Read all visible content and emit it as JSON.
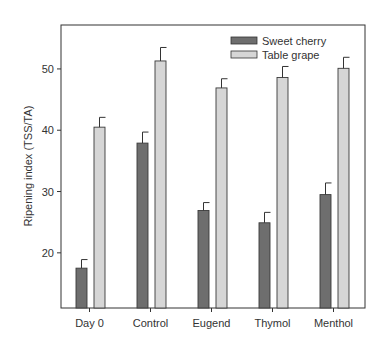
{
  "chart_data": {
    "type": "bar",
    "title": "",
    "xlabel": "",
    "ylabel": "Ripening index (TSS/TA)",
    "categories": [
      "Day 0",
      "Control",
      "Eugend",
      "Thymol",
      "Menthol"
    ],
    "series": [
      {
        "name": "Sweet cherry",
        "color": "#6e6e6e",
        "values": [
          17.5,
          37.9,
          26.9,
          24.9,
          29.5
        ],
        "error": [
          1.4,
          1.8,
          1.3,
          1.7,
          1.9
        ]
      },
      {
        "name": "Table grape",
        "color": "#d6d6d6",
        "values": [
          40.5,
          51.3,
          46.9,
          48.6,
          50.1
        ],
        "error": [
          1.6,
          2.2,
          1.5,
          1.8,
          1.8
        ]
      }
    ],
    "yticks": [
      20,
      30,
      40,
      50
    ],
    "ylim": [
      11,
      57
    ],
    "grid": false,
    "legend_position": "upper right",
    "error_bars": true
  },
  "legend": {
    "items": [
      "Sweet cherry",
      "Table grape"
    ]
  }
}
